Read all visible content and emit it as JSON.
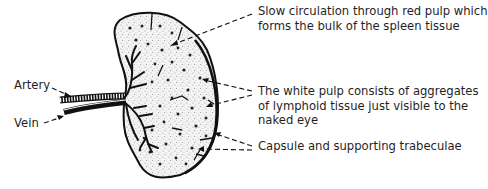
{
  "labels": {
    "artery": "Artery",
    "vein": "Vein",
    "red_pulp": {
      "line1": "Slow circulation through red pulp which",
      "line2": "forms the bulk of the spleen tissue"
    },
    "white_pulp": {
      "line1": "The white pulp consists of aggregates",
      "line2": "of lymphoid tissue just visible to the",
      "line3": "naked eye"
    },
    "capsule": "Capsule and supporting trabeculae"
  },
  "colors": {
    "ink": "#111111",
    "background": "#ffffff",
    "stipple": "#9a9a9a"
  }
}
